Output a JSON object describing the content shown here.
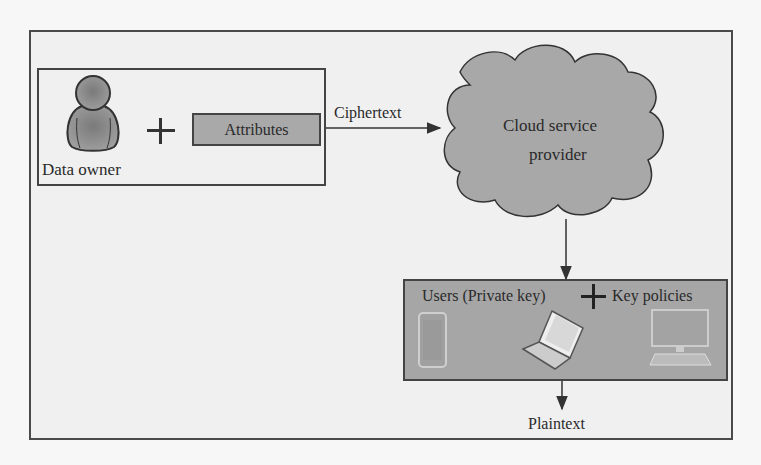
{
  "diagram": {
    "nodes": {
      "data_owner": {
        "label": "Data owner",
        "icon": "user-icon"
      },
      "attributes": {
        "label": "Attributes"
      },
      "cloud": {
        "line1": "Cloud service",
        "line2": "provider",
        "icon": "cloud-icon"
      },
      "users": {
        "label_left": "Users (Private key)",
        "label_right": "Key policies",
        "devices": [
          "smartphone-icon",
          "laptop-icon",
          "desktop-computer-icon"
        ]
      },
      "plaintext": {
        "label": "Plaintext"
      }
    },
    "edges": [
      {
        "from": "data_owner",
        "to": "cloud",
        "label": "Ciphertext"
      },
      {
        "from": "cloud",
        "to": "users",
        "label": ""
      },
      {
        "from": "users",
        "to": "plaintext",
        "label": ""
      }
    ],
    "operators": {
      "plus": "+"
    },
    "colors": {
      "fill_gray": "#a8a8a8",
      "stroke": "#444444",
      "background": "#f0f0f0"
    }
  }
}
